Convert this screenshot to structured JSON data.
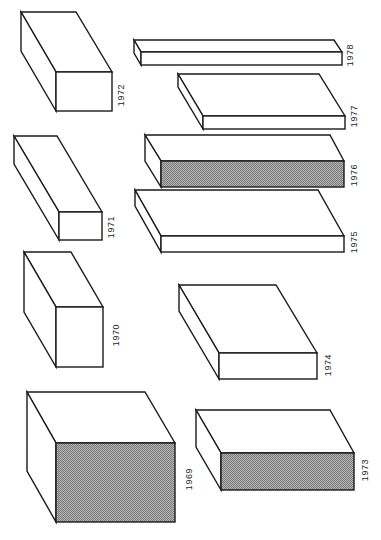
{
  "figure": {
    "colors": {
      "stroke": "#1a1a1a",
      "face": "#ffffff",
      "shade": "#9a9a9a",
      "label": "#222222"
    },
    "boxes": [
      {
        "year": "1969",
        "shaded": true,
        "back_tl": [
          27,
          392
        ],
        "back_tr": [
          145,
          392
        ],
        "front": [
          56,
          443,
          175,
          522
        ],
        "label_pos": [
          190,
          479
        ]
      },
      {
        "year": "1970",
        "shaded": false,
        "back_tl": [
          24,
          252
        ],
        "back_tr": [
          71,
          252
        ],
        "front": [
          56,
          307,
          103,
          367
        ],
        "label_pos": [
          117,
          335
        ]
      },
      {
        "year": "1971",
        "shaded": false,
        "back_tl": [
          14,
          136
        ],
        "back_tr": [
          57,
          136
        ],
        "front": [
          59,
          212,
          102,
          240
        ],
        "label_pos": [
          112,
          227
        ]
      },
      {
        "year": "1972",
        "shaded": false,
        "back_tl": [
          21,
          12
        ],
        "back_tr": [
          76,
          12
        ],
        "front": [
          56,
          72,
          112,
          111
        ],
        "label_pos": [
          122,
          95
        ]
      },
      {
        "year": "1973",
        "shaded": true,
        "back_tl": [
          196,
          410
        ],
        "back_tr": [
          330,
          410
        ],
        "front": [
          221,
          453,
          354,
          490
        ],
        "label_pos": [
          366,
          470
        ]
      },
      {
        "year": "1974",
        "shaded": false,
        "back_tl": [
          179,
          285
        ],
        "back_tr": [
          276,
          285
        ],
        "front": [
          219,
          353,
          317,
          379
        ],
        "label_pos": [
          329,
          365
        ]
      },
      {
        "year": "1975",
        "shaded": false,
        "back_tl": [
          135,
          190
        ],
        "back_tr": [
          318,
          190
        ],
        "front": [
          161,
          236,
          344,
          252
        ],
        "label_pos": [
          355,
          242
        ]
      },
      {
        "year": "1976",
        "shaded": true,
        "back_tl": [
          145,
          135
        ],
        "back_tr": [
          330,
          135
        ],
        "front": [
          161,
          161,
          344,
          187
        ],
        "label_pos": [
          355,
          175
        ]
      },
      {
        "year": "1977",
        "shaded": false,
        "back_tl": [
          178,
          74
        ],
        "back_tr": [
          319,
          74
        ],
        "front": [
          203,
          116,
          345,
          129
        ],
        "label_pos": [
          355,
          116
        ]
      },
      {
        "year": "1978",
        "shaded": false,
        "back_tl": [
          134,
          40
        ],
        "back_tr": [
          334,
          40
        ],
        "front": [
          141,
          52,
          342,
          65
        ],
        "label_pos": [
          351,
          55
        ]
      }
    ]
  }
}
